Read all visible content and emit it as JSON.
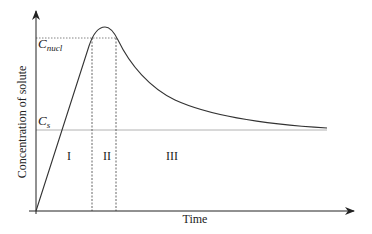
{
  "diagram": {
    "type": "concentration-time curve (LaMer diagram)",
    "y_axis_label": "Concentration of solute",
    "x_axis_label": "Time",
    "levels": [
      {
        "symbol": "C",
        "subscript": "nucl",
        "y": 38
      },
      {
        "symbol": "C",
        "subscript": "s",
        "y": 130
      }
    ],
    "regions": [
      {
        "label": "I",
        "x": 69
      },
      {
        "label": "II",
        "x": 107
      },
      {
        "label": "III",
        "x": 172
      }
    ],
    "colors": {
      "stroke": "#333333",
      "dashed": "#555555",
      "cs_line": "#9a9a9a"
    }
  }
}
